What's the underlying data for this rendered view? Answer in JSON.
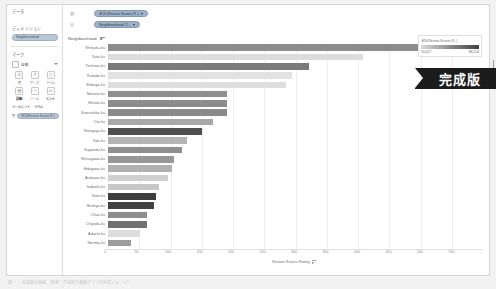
{
  "app": {
    "ribbon_label": "完成版",
    "caption": "図 ・・ 完成版の画面 （参考：作成後の横棒グラフの完成イメージ）"
  },
  "sidebar": {
    "data_section_title": "データ",
    "data_source_pill": "Tokyo Airbnb listings",
    "dimensions_title": "ディメンション",
    "dimension_pill": "Neighbourhood",
    "marks_title": "マーク",
    "mark_type_label": "自動",
    "shelf_cells": [
      {
        "icon": "⠿",
        "caption": "色",
        "bold": false
      },
      {
        "icon": "T",
        "caption": "サイズ",
        "bold": false
      },
      {
        "icon": "◻",
        "caption": "ラベル",
        "bold": false
      },
      {
        "icon": "▤",
        "caption": "詳細",
        "bold": true
      },
      {
        "icon": "◔",
        "caption": "ツール",
        "bold": false
      },
      {
        "icon": "▭",
        "caption": "ヒント",
        "bold": true
      }
    ],
    "mark_pill_tag": "色",
    "mark_pill_label": "合計(Review Scores R..)",
    "sub_caption_left": "ツールヒント",
    "sub_caption_right": "ラベル"
  },
  "shelves": [
    {
      "name": "列",
      "pill": "合計(Review Scores R..)"
    },
    {
      "name": "行",
      "pill": "Neighbourhood Cl..."
    }
  ],
  "viz": {
    "row_header_title": "Neighbourhood",
    "x_axis_title": "Review Scores Rating"
  },
  "legend": {
    "title": "合計(Review Scores R..)",
    "min": "50,027",
    "max": "88,224",
    "color_low": "#d9d9d9",
    "color_high": "#3f3f3f"
  },
  "chart_data": {
    "type": "bar",
    "orientation": "horizontal",
    "title": "",
    "xlabel": "Review Scores Rating",
    "ylabel": "Neighbourhood",
    "xlim": [
      0,
      600
    ],
    "grid": true,
    "xticks": [
      0,
      50,
      100,
      150,
      200,
      250,
      300,
      350,
      400,
      450,
      500,
      550
    ],
    "legend_position": "top-right",
    "color_field": "合計(Review Scores R..)",
    "categories": [
      "Shinjuku-ku",
      "Taito-ku",
      "Toshima-ku",
      "Sumida-ku",
      "Shibuya-ku",
      "Nakano-ku",
      "Minato-ku",
      "Katsushika-ku",
      "Ota-ku",
      "Setagaya-ku",
      "Kita-ku",
      "Suginami-ku",
      "Shinagawa-ku",
      "Edogawa-ku",
      "Arakawa-ku",
      "Itabashi-ku",
      "Koto-ku",
      "Bunkyo-ku",
      "Chuo-ku",
      "Chiyoda-ku",
      "Adachi-ku",
      "Nerima-ku"
    ],
    "values": [
      567,
      408,
      322,
      294,
      285,
      190,
      190,
      190,
      168,
      151,
      127,
      118,
      106,
      102,
      96,
      82,
      77,
      74,
      62,
      62,
      51,
      36
    ],
    "colors": [
      "#8c8c8c",
      "#dcdcdc",
      "#7a7a7a",
      "#e2e2e2",
      "#dedede",
      "#8f8f8f",
      "#8c8c8c",
      "#8a8a8a",
      "#a8a8a8",
      "#4f4f4f",
      "#b4b4b4",
      "#8f8f8f",
      "#979797",
      "#b0b0b0",
      "#cfcfcf",
      "#c6c6c6",
      "#3d3d3d",
      "#414141",
      "#8d8d8d",
      "#707070",
      "#dcdcdc",
      "#9d9d9d"
    ]
  }
}
